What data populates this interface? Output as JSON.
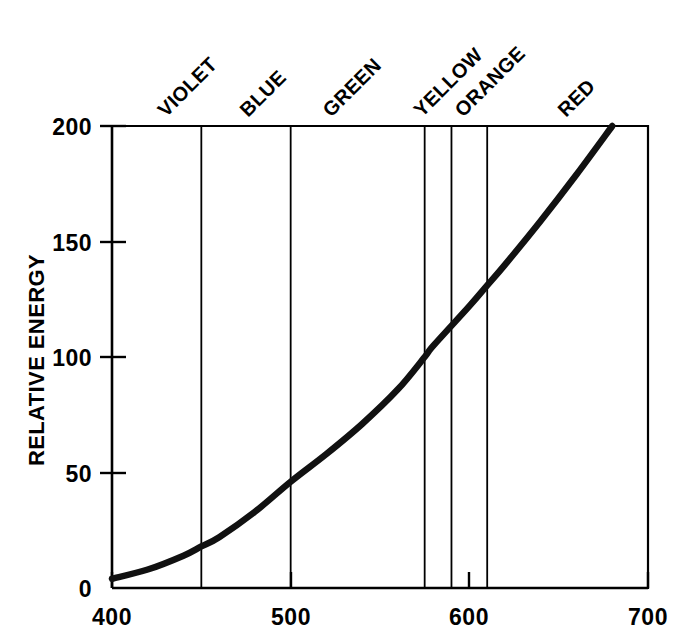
{
  "chart_data": {
    "type": "line",
    "title": "",
    "subtitle": "",
    "xlabel": "",
    "ylabel": "RELATIVE ENERGY",
    "xlim": [
      400,
      700
    ],
    "ylim": [
      0,
      200
    ],
    "grid": false,
    "legend": "none",
    "x_ticks": [
      400,
      500,
      600,
      700
    ],
    "x_tick_labels": [
      "400",
      "500",
      "600",
      "700"
    ],
    "y_ticks": [
      0,
      50,
      100,
      150,
      200
    ],
    "y_tick_labels": [
      "0",
      "50",
      "100",
      "150",
      "200"
    ],
    "series": [
      {
        "name": "Relative Energy",
        "color": "#111111",
        "x": [
          400,
          420,
          440,
          450,
          460,
          480,
          500,
          520,
          540,
          560,
          575,
          580,
          600,
          610,
          620,
          640,
          660,
          680
        ],
        "values": [
          4,
          8,
          14,
          18,
          22,
          33,
          46,
          58,
          71,
          86,
          100,
          105,
          122,
          131,
          140,
          159,
          179,
          200
        ]
      }
    ],
    "band_boundaries": [
      450,
      500,
      575,
      590,
      610
    ],
    "bands": [
      {
        "label": "VIOLET",
        "x": 430,
        "range": [
          400,
          450
        ]
      },
      {
        "label": "BLUE",
        "x": 478,
        "range": [
          450,
          500
        ]
      },
      {
        "label": "GREEN",
        "x": 540,
        "range": [
          500,
          575
        ]
      },
      {
        "label": "YELLOW",
        "x": 584,
        "range": [
          575,
          590
        ]
      },
      {
        "label": "ORANGE",
        "x": 604,
        "range": [
          590,
          610
        ]
      },
      {
        "label": "RED",
        "x": 655,
        "range": [
          610,
          700
        ]
      }
    ],
    "annotations": []
  }
}
